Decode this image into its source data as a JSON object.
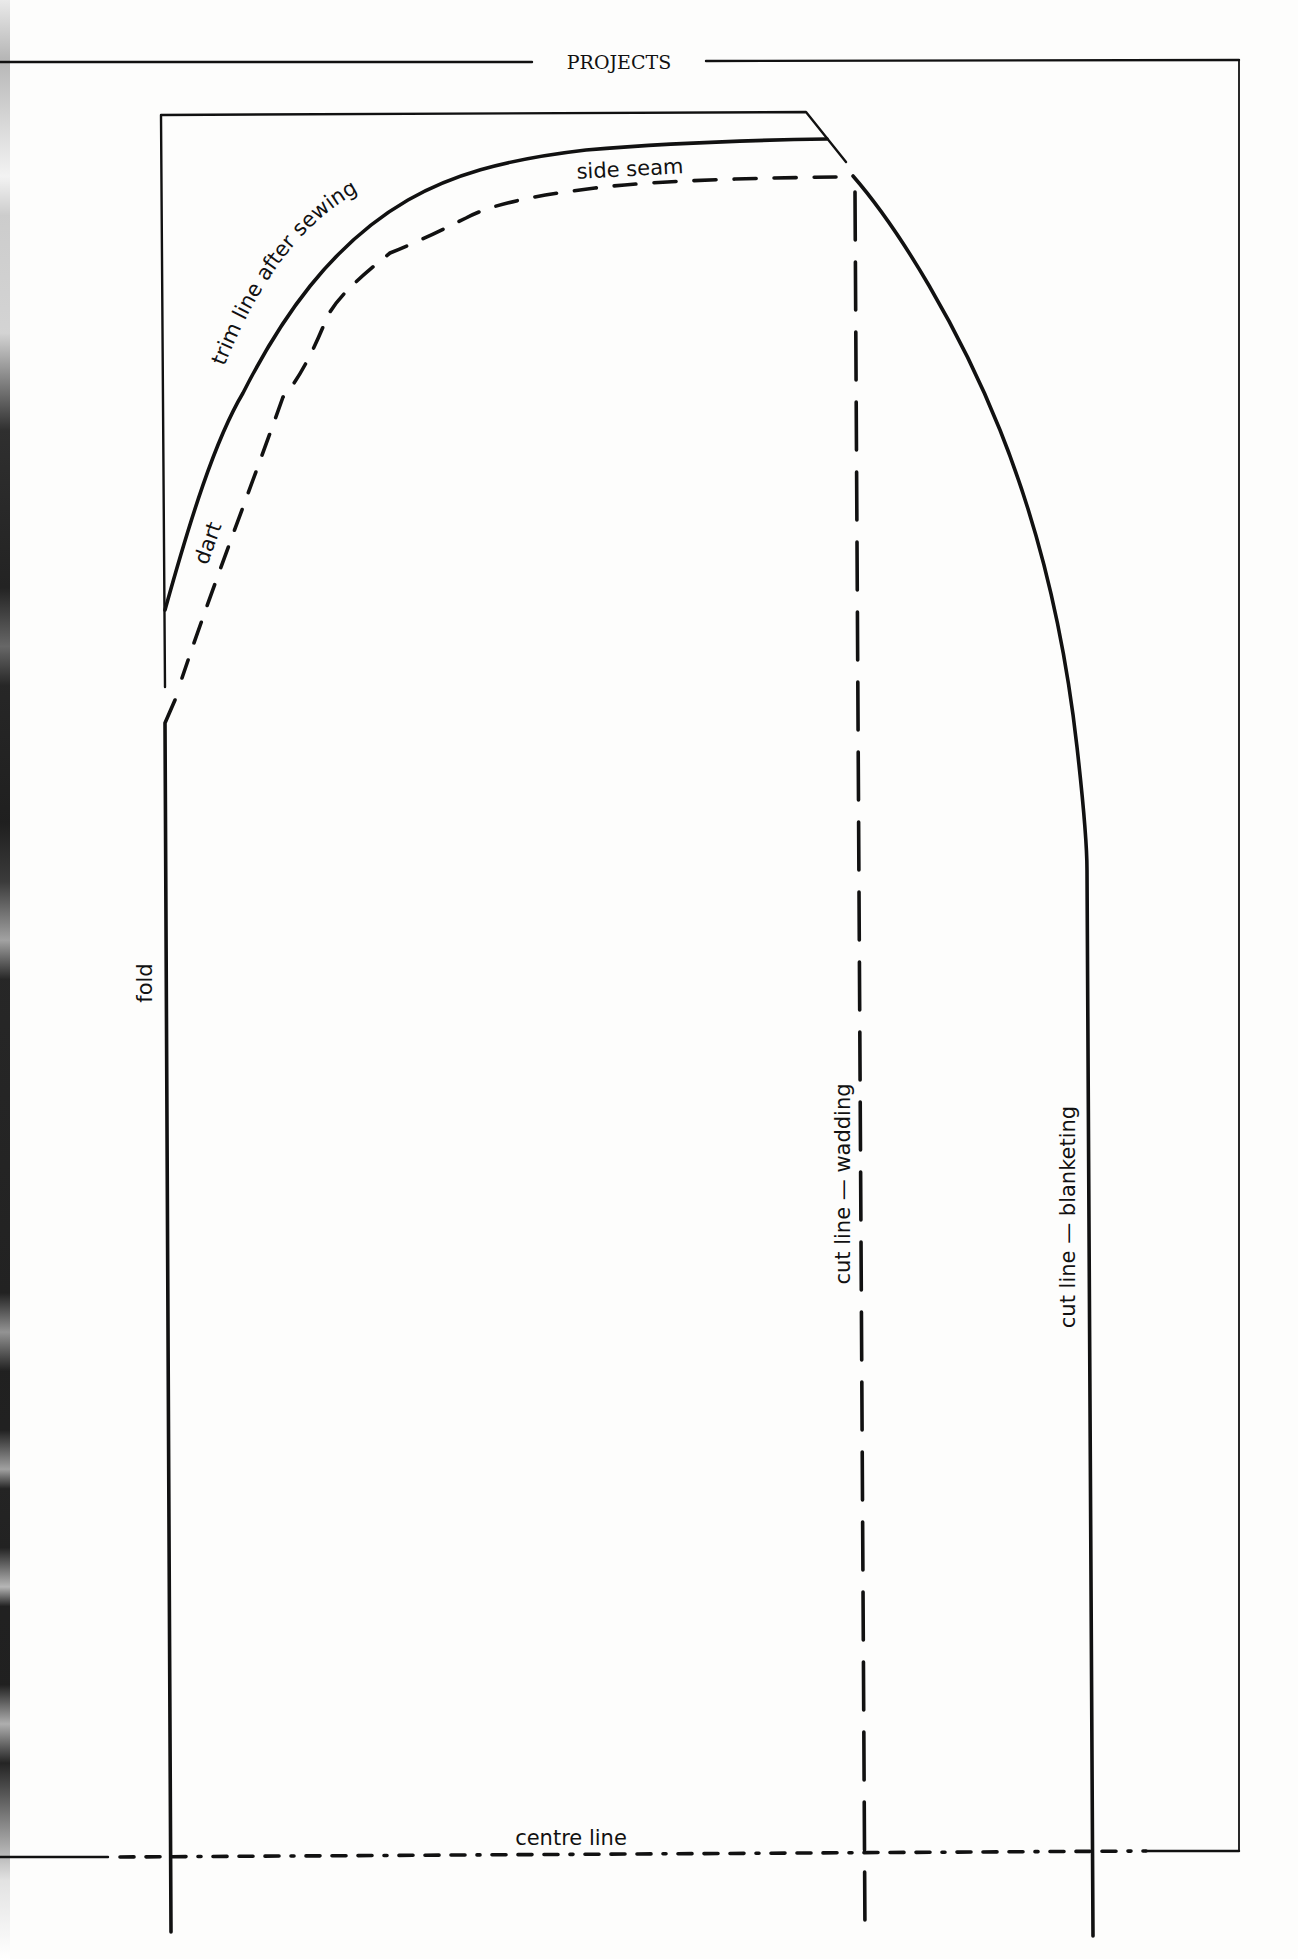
{
  "page": {
    "header_title": "PROJECTS",
    "ink_color": "#111111",
    "paper_color": "#fdfdfc"
  },
  "pattern": {
    "labels": {
      "trim_line": "trim line after sewing",
      "side_seam": "side seam",
      "dart": "dart",
      "fold": "fold",
      "cut_line_wadding": "cut line — wadding",
      "cut_line_blanketing": "cut line — blanketing",
      "centre_line": "centre line"
    },
    "line_styles": {
      "trim_line": "solid",
      "seam_line": "dashed",
      "fold": "solid",
      "cut_line_wadding": "dashed",
      "cut_line_blanketing": "solid",
      "centre_line": "dash-dot"
    }
  }
}
